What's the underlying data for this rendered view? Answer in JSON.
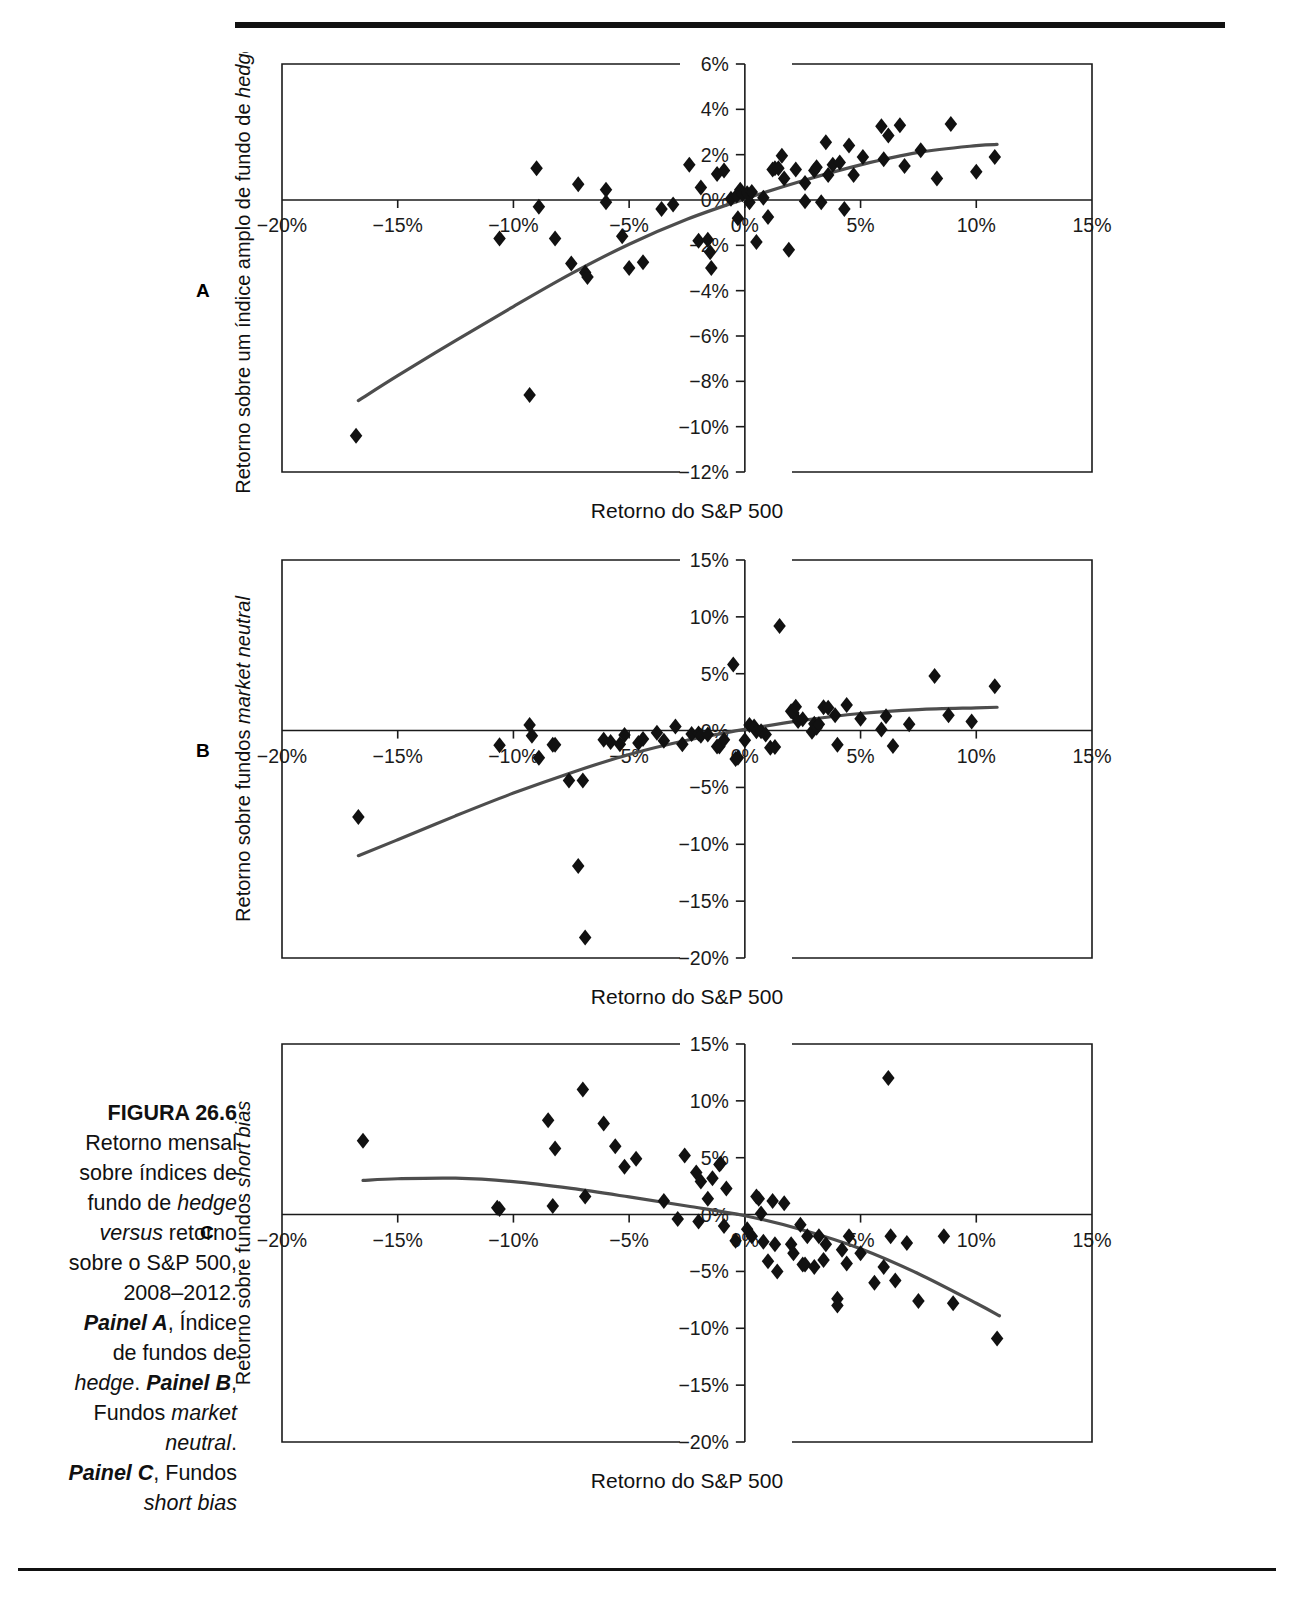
{
  "figure": {
    "label": "FIGURA 26.6",
    "caption_lines": [
      {
        "text": "Retorno mensal",
        "style": "normal"
      },
      {
        "text": "sobre índices de",
        "style": "normal"
      },
      {
        "text": "fundo de ",
        "style": "normal"
      },
      {
        "text": "versus retorno",
        "style": "normal"
      },
      {
        "text": "sobre o S&P 500,",
        "style": "normal"
      },
      {
        "text": "2008–2012.",
        "style": "normal"
      },
      {
        "text": "Painel A, Índice",
        "style": "mixed"
      },
      {
        "text": "de fundos de",
        "style": "normal"
      },
      {
        "text": "hedge. Painel B,",
        "style": "mixed"
      },
      {
        "text": "Fundos market",
        "style": "mixed"
      },
      {
        "text": "neutral.",
        "style": "italic"
      },
      {
        "text": "Painel C, Fundos",
        "style": "mixed"
      },
      {
        "text": "short bias",
        "style": "italic"
      }
    ],
    "caption_full": "FIGURA 26.6 Retorno mensal sobre índices de fundo de hedge versus retorno sobre o S&P 500, 2008–2012. Painel A, Índice de fundos de hedge. Painel B, Fundos market neutral. Painel C, Fundos short bias"
  },
  "panel_letters": {
    "a": "A",
    "b": "B",
    "c": "C"
  },
  "chart_data": [
    {
      "type": "scatter",
      "panel": "A",
      "title": "",
      "xlabel": "Retorno do S&P 500",
      "ylabel": "Retorno sobre um índice amplo de fundo de hedge",
      "ylabel_italic_part": "hedge",
      "xlim": [
        -20,
        15
      ],
      "ylim": [
        -12,
        6
      ],
      "xticks": [
        -20,
        -15,
        -10,
        -5,
        0,
        5,
        10,
        15
      ],
      "xticklabels": [
        "-20%",
        "-15%",
        "-10%",
        "-5%",
        "0%",
        "5%",
        "10%",
        "15%"
      ],
      "yticks": [
        6,
        4,
        2,
        0,
        -2,
        -4,
        -6,
        -8,
        -10,
        -12
      ],
      "yticklabels": [
        "6%",
        "4%",
        "2%",
        "0%",
        "-2%",
        "-4%",
        "-6%",
        "-8%",
        "-10%",
        "-12%"
      ],
      "grid": false,
      "legend": null,
      "points": [
        [
          -16.8,
          -10.4
        ],
        [
          -9.3,
          -8.6
        ],
        [
          -10.6,
          -1.7
        ],
        [
          -9.0,
          1.4
        ],
        [
          -8.9,
          -0.3
        ],
        [
          -8.2,
          -1.7
        ],
        [
          -7.5,
          -2.8
        ],
        [
          -7.2,
          0.7
        ],
        [
          -6.9,
          -3.2
        ],
        [
          -6.8,
          -3.4
        ],
        [
          -6.0,
          0.45
        ],
        [
          -6.0,
          -0.1
        ],
        [
          -5.3,
          -1.6
        ],
        [
          -5.0,
          -3.0
        ],
        [
          -4.4,
          -2.75
        ],
        [
          -3.6,
          -0.4
        ],
        [
          -3.1,
          -0.2
        ],
        [
          -2.4,
          1.55
        ],
        [
          -2.0,
          -1.8
        ],
        [
          -1.9,
          0.55
        ],
        [
          -1.6,
          -1.75
        ],
        [
          -1.5,
          -2.3
        ],
        [
          -1.45,
          -3.0
        ],
        [
          -1.2,
          1.15
        ],
        [
          -0.9,
          1.3
        ],
        [
          -0.6,
          0.05
        ],
        [
          -0.35,
          0.2
        ],
        [
          -0.3,
          -0.8
        ],
        [
          -0.2,
          0.45
        ],
        [
          -0.1,
          0.25
        ],
        [
          0.1,
          0.3
        ],
        [
          0.2,
          -0.1
        ],
        [
          0.3,
          0.35
        ],
        [
          0.5,
          -1.85
        ],
        [
          0.8,
          0.1
        ],
        [
          1.0,
          -0.75
        ],
        [
          1.2,
          1.35
        ],
        [
          1.3,
          1.4
        ],
        [
          1.45,
          1.4
        ],
        [
          1.6,
          1.95
        ],
        [
          1.7,
          0.95
        ],
        [
          1.9,
          -2.2
        ],
        [
          2.2,
          1.35
        ],
        [
          2.6,
          0.75
        ],
        [
          2.6,
          -0.05
        ],
        [
          3.0,
          1.3
        ],
        [
          3.1,
          1.45
        ],
        [
          3.3,
          -0.1
        ],
        [
          3.5,
          2.55
        ],
        [
          3.6,
          1.1
        ],
        [
          3.8,
          1.55
        ],
        [
          4.1,
          1.65
        ],
        [
          4.3,
          -0.4
        ],
        [
          4.5,
          2.4
        ],
        [
          4.7,
          1.1
        ],
        [
          5.1,
          1.9
        ],
        [
          5.9,
          3.25
        ],
        [
          6.0,
          1.8
        ],
        [
          6.2,
          2.85
        ],
        [
          6.7,
          3.3
        ],
        [
          6.9,
          1.5
        ],
        [
          7.6,
          2.2
        ],
        [
          8.3,
          0.95
        ],
        [
          8.9,
          3.35
        ],
        [
          10.0,
          1.25
        ],
        [
          10.8,
          1.9
        ]
      ],
      "fit_curve": [
        [
          -16.7,
          -8.85
        ],
        [
          -15,
          -7.75
        ],
        [
          -12.5,
          -6.2
        ],
        [
          -10,
          -4.7
        ],
        [
          -7.5,
          -3.25
        ],
        [
          -5,
          -1.95
        ],
        [
          -2.5,
          -0.85
        ],
        [
          0,
          0.05
        ],
        [
          2.5,
          0.85
        ],
        [
          5,
          1.55
        ],
        [
          7.5,
          2.1
        ],
        [
          10,
          2.4
        ],
        [
          10.9,
          2.45
        ]
      ]
    },
    {
      "type": "scatter",
      "panel": "B",
      "title": "",
      "xlabel": "Retorno do S&P 500",
      "ylabel": "Retorno sobre fundos market neutral",
      "ylabel_italic_part": "market neutral",
      "xlim": [
        -20,
        15
      ],
      "ylim": [
        -20,
        15
      ],
      "xticks": [
        -20,
        -15,
        -10,
        -5,
        0,
        5,
        10,
        15
      ],
      "xticklabels": [
        "-20%",
        "-15%",
        "-10%",
        "-5%",
        "0%",
        "5%",
        "10%",
        "15%"
      ],
      "yticks": [
        15,
        10,
        5,
        0,
        -5,
        -10,
        -15,
        -20
      ],
      "yticklabels": [
        "15%",
        "10%",
        "5%",
        "0%",
        "-5%",
        "-10%",
        "-15%",
        "-20%"
      ],
      "grid": false,
      "legend": null,
      "points": [
        [
          -16.7,
          -7.6
        ],
        [
          -10.6,
          -1.3
        ],
        [
          -9.3,
          0.5
        ],
        [
          -9.2,
          -0.45
        ],
        [
          -8.9,
          -2.4
        ],
        [
          -8.3,
          -1.25
        ],
        [
          -8.2,
          -1.25
        ],
        [
          -7.6,
          -4.4
        ],
        [
          -7.2,
          -11.9
        ],
        [
          -7.0,
          -4.4
        ],
        [
          -6.9,
          -18.2
        ],
        [
          -6.1,
          -0.8
        ],
        [
          -5.8,
          -1.0
        ],
        [
          -5.4,
          -1.2
        ],
        [
          -5.2,
          -0.4
        ],
        [
          -4.6,
          -1.1
        ],
        [
          -4.4,
          -0.75
        ],
        [
          -3.8,
          -0.2
        ],
        [
          -3.5,
          -0.9
        ],
        [
          -3.0,
          0.35
        ],
        [
          -2.7,
          -1.2
        ],
        [
          -2.3,
          -0.3
        ],
        [
          -2.0,
          -0.25
        ],
        [
          -1.9,
          -0.45
        ],
        [
          -1.6,
          -0.35
        ],
        [
          -1.2,
          -1.4
        ],
        [
          -1.1,
          -1.4
        ],
        [
          -0.9,
          -0.8
        ],
        [
          -0.5,
          5.8
        ],
        [
          -0.4,
          -2.5
        ],
        [
          -0.3,
          -2.4
        ],
        [
          0.0,
          -0.85
        ],
        [
          0.2,
          0.5
        ],
        [
          0.4,
          0.35
        ],
        [
          0.5,
          -0.05
        ],
        [
          0.7,
          -0.05
        ],
        [
          0.9,
          -0.35
        ],
        [
          1.1,
          -1.5
        ],
        [
          1.3,
          -1.45
        ],
        [
          1.5,
          9.2
        ],
        [
          2.0,
          1.7
        ],
        [
          2.1,
          1.55
        ],
        [
          2.2,
          2.1
        ],
        [
          2.3,
          0.85
        ],
        [
          2.5,
          1.0
        ],
        [
          2.9,
          -0.1
        ],
        [
          3.0,
          0.6
        ],
        [
          3.1,
          0.25
        ],
        [
          3.2,
          0.55
        ],
        [
          3.4,
          2.05
        ],
        [
          3.6,
          2.0
        ],
        [
          3.9,
          1.35
        ],
        [
          4.0,
          -1.25
        ],
        [
          4.4,
          2.25
        ],
        [
          5.0,
          1.05
        ],
        [
          5.9,
          0.1
        ],
        [
          6.1,
          1.25
        ],
        [
          6.4,
          -1.35
        ],
        [
          7.1,
          0.55
        ],
        [
          8.2,
          4.8
        ],
        [
          8.8,
          1.35
        ],
        [
          9.8,
          0.8
        ],
        [
          10.8,
          3.9
        ]
      ],
      "fit_curve": [
        [
          -16.7,
          -11.0
        ],
        [
          -15,
          -9.6
        ],
        [
          -12.5,
          -7.5
        ],
        [
          -10,
          -5.5
        ],
        [
          -7.5,
          -3.7
        ],
        [
          -5,
          -2.1
        ],
        [
          -2.5,
          -0.85
        ],
        [
          0,
          0.1
        ],
        [
          2.5,
          0.9
        ],
        [
          5,
          1.5
        ],
        [
          7.5,
          1.85
        ],
        [
          10,
          2.0
        ],
        [
          10.9,
          2.05
        ]
      ]
    },
    {
      "type": "scatter",
      "panel": "C",
      "title": "",
      "xlabel": "Retorno do S&P 500",
      "ylabel": "Retorno sobre fundos short bias",
      "ylabel_italic_part": "short bias",
      "xlim": [
        -20,
        15
      ],
      "ylim": [
        -20,
        15
      ],
      "xticks": [
        -20,
        -15,
        -10,
        -5,
        0,
        5,
        10,
        15
      ],
      "xticklabels": [
        "-20%",
        "-15%",
        "-10%",
        "-5%",
        "0%",
        "5%",
        "10%",
        "15%"
      ],
      "yticks": [
        15,
        10,
        5,
        0,
        -5,
        -10,
        -15,
        -20
      ],
      "yticklabels": [
        "15%",
        "10%",
        "5%",
        "0%",
        "-5%",
        "-10%",
        "-15%",
        "-20%"
      ],
      "grid": false,
      "legend": null,
      "points": [
        [
          -16.5,
          6.5
        ],
        [
          -10.7,
          0.6
        ],
        [
          -10.6,
          0.5
        ],
        [
          -8.5,
          8.3
        ],
        [
          -8.3,
          0.75
        ],
        [
          -8.2,
          5.8
        ],
        [
          -7.0,
          11.0
        ],
        [
          -6.9,
          1.6
        ],
        [
          -6.1,
          8.0
        ],
        [
          -5.6,
          6.0
        ],
        [
          -5.2,
          4.2
        ],
        [
          -4.7,
          4.9
        ],
        [
          -3.5,
          1.2
        ],
        [
          -2.9,
          -0.4
        ],
        [
          -2.6,
          5.2
        ],
        [
          -2.1,
          3.7
        ],
        [
          -2.0,
          -0.6
        ],
        [
          -1.9,
          2.9
        ],
        [
          -1.6,
          1.4
        ],
        [
          -1.4,
          3.2
        ],
        [
          -1.1,
          4.4
        ],
        [
          -1.05,
          4.5
        ],
        [
          -0.9,
          -1.0
        ],
        [
          -0.8,
          2.3
        ],
        [
          -0.4,
          -2.3
        ],
        [
          0.1,
          -1.3
        ],
        [
          0.3,
          -1.9
        ],
        [
          0.5,
          1.6
        ],
        [
          0.6,
          1.4
        ],
        [
          0.7,
          0.1
        ],
        [
          0.8,
          -2.4
        ],
        [
          1.0,
          -4.1
        ],
        [
          1.2,
          1.2
        ],
        [
          1.3,
          -2.6
        ],
        [
          1.4,
          -5.0
        ],
        [
          1.7,
          1.0
        ],
        [
          2.0,
          -2.6
        ],
        [
          2.1,
          -3.4
        ],
        [
          2.4,
          -0.9
        ],
        [
          2.5,
          -4.4
        ],
        [
          2.6,
          -4.4
        ],
        [
          2.7,
          -1.9
        ],
        [
          3.0,
          -4.6
        ],
        [
          3.2,
          -1.9
        ],
        [
          3.4,
          -4.0
        ],
        [
          3.5,
          -2.6
        ],
        [
          4.0,
          -7.4
        ],
        [
          4.0,
          -8.0
        ],
        [
          4.2,
          -3.1
        ],
        [
          4.4,
          -4.3
        ],
        [
          4.5,
          -1.9
        ],
        [
          5.0,
          -3.4
        ],
        [
          5.6,
          -6.0
        ],
        [
          6.0,
          -4.6
        ],
        [
          6.2,
          12.0
        ],
        [
          6.3,
          -1.9
        ],
        [
          6.5,
          -5.8
        ],
        [
          7.0,
          -2.5
        ],
        [
          7.5,
          -7.6
        ],
        [
          8.6,
          -1.9
        ],
        [
          9.0,
          -7.8
        ],
        [
          10.9,
          -10.9
        ]
      ],
      "fit_curve": [
        [
          -16.5,
          3.0
        ],
        [
          -15,
          3.15
        ],
        [
          -12.5,
          3.2
        ],
        [
          -10,
          2.9
        ],
        [
          -7.5,
          2.3
        ],
        [
          -5,
          1.55
        ],
        [
          -2.5,
          0.75
        ],
        [
          0,
          -0.1
        ],
        [
          2.5,
          -1.35
        ],
        [
          5,
          -3.0
        ],
        [
          7.5,
          -5.2
        ],
        [
          10,
          -7.8
        ],
        [
          11.0,
          -8.9
        ]
      ]
    }
  ]
}
